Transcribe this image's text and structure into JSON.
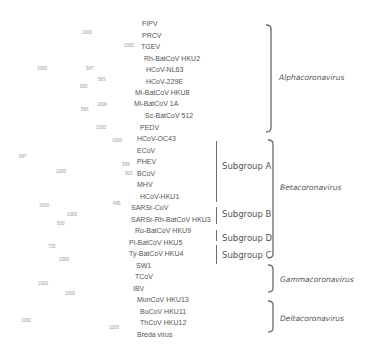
{
  "figure": {
    "type": "phylogenetic-tree",
    "taxa": [
      {
        "name": "FIPV",
        "x": 142,
        "y": 20
      },
      {
        "name": "PRCV",
        "x": 142,
        "y": 32
      },
      {
        "name": "TGEV",
        "x": 141,
        "y": 43
      },
      {
        "name": "Rh-BatCoV HKU2",
        "x": 144,
        "y": 55
      },
      {
        "name": "HCoV-NL63",
        "x": 146,
        "y": 66
      },
      {
        "name": "HCoV-229E",
        "x": 146,
        "y": 78
      },
      {
        "name": "Mi-BatCoV HKU8",
        "x": 135,
        "y": 89
      },
      {
        "name": "Mi-BatCoV 1A",
        "x": 134,
        "y": 100
      },
      {
        "name": "Sc-BatCoV 512",
        "x": 145,
        "y": 112
      },
      {
        "name": "PEDV",
        "x": 140,
        "y": 124
      },
      {
        "name": "HCoV-OC43",
        "x": 137,
        "y": 135
      },
      {
        "name": "ECoV",
        "x": 137,
        "y": 147
      },
      {
        "name": "PHEV",
        "x": 137,
        "y": 158
      },
      {
        "name": "BCoV",
        "x": 137,
        "y": 170
      },
      {
        "name": "MHV",
        "x": 137,
        "y": 181
      },
      {
        "name": "HCoV-HKU1",
        "x": 140,
        "y": 193
      },
      {
        "name": "SARSr-CoV",
        "x": 131,
        "y": 204
      },
      {
        "name": "SARSr-Rh-BatCoV HKU3",
        "x": 131,
        "y": 216
      },
      {
        "name": "Ro-BatCoV HKU9",
        "x": 135,
        "y": 227
      },
      {
        "name": "Pi-BatCoV HKU5",
        "x": 129,
        "y": 239
      },
      {
        "name": "Ty-BatCoV HKU4",
        "x": 129,
        "y": 250
      },
      {
        "name": "SW1",
        "x": 136,
        "y": 262
      },
      {
        "name": "TCoV",
        "x": 135,
        "y": 273
      },
      {
        "name": "IBV",
        "x": 133,
        "y": 285
      },
      {
        "name": "MunCoV HKU13",
        "x": 137,
        "y": 296
      },
      {
        "name": "BuCoV HKU11",
        "x": 140,
        "y": 308
      },
      {
        "name": "ThCoV HKU12",
        "x": 140,
        "y": 319
      },
      {
        "name": "Breda virus",
        "x": 137,
        "y": 331
      }
    ],
    "bootstrap": [
      {
        "value": "1000",
        "x": 82,
        "y": 30
      },
      {
        "value": "1000",
        "x": 124,
        "y": 43
      },
      {
        "value": "1000",
        "x": 37,
        "y": 66
      },
      {
        "value": "547",
        "x": 86,
        "y": 66
      },
      {
        "value": "583",
        "x": 98,
        "y": 77
      },
      {
        "value": "600",
        "x": 80,
        "y": 84
      },
      {
        "value": "1000",
        "x": 97,
        "y": 102
      },
      {
        "value": "566",
        "x": 81,
        "y": 107
      },
      {
        "value": "1000",
        "x": 96,
        "y": 125
      },
      {
        "value": "1000",
        "x": 112,
        "y": 138
      },
      {
        "value": "997",
        "x": 19,
        "y": 154
      },
      {
        "value": "599",
        "x": 122,
        "y": 162
      },
      {
        "value": "1000",
        "x": 56,
        "y": 169
      },
      {
        "value": "903",
        "x": 125,
        "y": 171
      },
      {
        "value": "645",
        "x": 113,
        "y": 201
      },
      {
        "value": "1000",
        "x": 39,
        "y": 203
      },
      {
        "value": "1000",
        "x": 67,
        "y": 212
      },
      {
        "value": "500",
        "x": 57,
        "y": 221
      },
      {
        "value": "725",
        "x": 48,
        "y": 244
      },
      {
        "value": "1000",
        "x": 59,
        "y": 257
      },
      {
        "value": "1000",
        "x": 38,
        "y": 281
      },
      {
        "value": "1000",
        "x": 65,
        "y": 291
      },
      {
        "value": "1000",
        "x": 21,
        "y": 318
      },
      {
        "value": "1000",
        "x": 109,
        "y": 325
      }
    ],
    "subgroups": [
      {
        "label": "Subgroup A",
        "bar_x": 216,
        "bar_top": 141,
        "bar_bottom": 202,
        "label_x": 222,
        "label_y": 161
      },
      {
        "label": "Subgroup B",
        "bar_x": 216,
        "bar_top": 207,
        "bar_bottom": 224,
        "label_x": 222,
        "label_y": 209
      },
      {
        "label": "Subgroup D",
        "bar_x": 216,
        "bar_top": 230,
        "bar_bottom": 241,
        "label_x": 222,
        "label_y": 233
      },
      {
        "label": "Subgroup C",
        "bar_x": 216,
        "bar_top": 245,
        "bar_bottom": 264,
        "label_x": 222,
        "label_y": 250
      }
    ],
    "genera": [
      {
        "label": "Alphacoronavirus",
        "top": 25,
        "bottom": 132,
        "bracket_x": 271,
        "label_x": 279,
        "label_y": 73
      },
      {
        "label": "Betacoronavirus",
        "top": 140,
        "bottom": 258,
        "bracket_x": 273,
        "label_x": 280,
        "label_y": 183
      },
      {
        "label": "Gammacoronavirus",
        "top": 265,
        "bottom": 292,
        "bracket_x": 273,
        "label_x": 280,
        "label_y": 275
      },
      {
        "label": "Deltacoronavirus",
        "top": 301,
        "bottom": 332,
        "bracket_x": 273,
        "label_x": 280,
        "label_y": 314
      }
    ],
    "colors": {
      "text": "#555555",
      "bootstrap": "#9a9a9a",
      "bracket": "#6a6a6a",
      "background": "#ffffff"
    }
  }
}
